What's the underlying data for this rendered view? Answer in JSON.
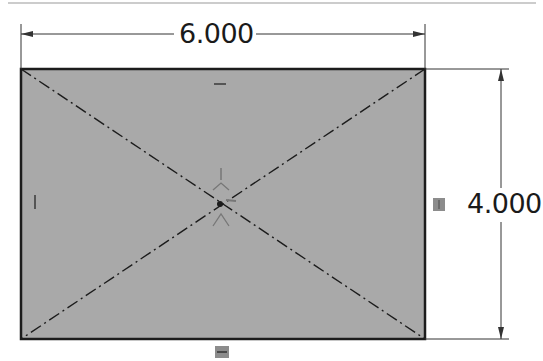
{
  "sketch": {
    "rectangle": {
      "x": 21,
      "y": 69,
      "width": 404,
      "height": 270,
      "fill": "#a9a9a9",
      "stroke": "#1c1c1c"
    },
    "origin": {
      "x": 220,
      "y": 204
    },
    "colors": {
      "line": "#1c1c1c",
      "dimension": "#333333",
      "relation_badge": "#8c8c8c"
    }
  },
  "dimensions": {
    "width": {
      "label": "6.000",
      "value": 6.0
    },
    "height": {
      "label": "4.000",
      "value": 4.0
    }
  },
  "relations": {
    "top": "horizontal",
    "bottom": "horizontal",
    "left": "vertical",
    "right": "vertical"
  }
}
